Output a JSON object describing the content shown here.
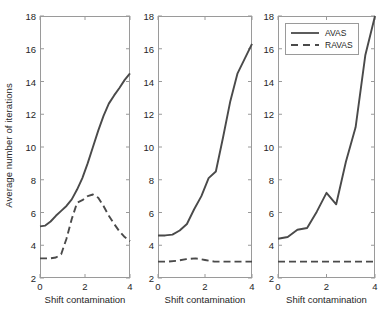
{
  "chart_data": {
    "type": "line",
    "title": "",
    "xlabel": "Shift contamination",
    "ylabel": "Average number of iterations",
    "xlim": [
      0,
      4
    ],
    "ylim": [
      2,
      18
    ],
    "xticks": [
      0,
      2,
      4
    ],
    "yticks": [
      2,
      4,
      6,
      8,
      10,
      12,
      14,
      16,
      18
    ],
    "xtick_labels": [
      "0",
      "2",
      "4"
    ],
    "ytick_labels": [
      "2",
      "4",
      "6",
      "8",
      "10",
      "12",
      "14",
      "16",
      "18"
    ],
    "grid": false,
    "legend_position": "top-left of third panel",
    "legend_entries": [
      "AVAS",
      "RAVAS"
    ],
    "line_color": "#4a4a4a",
    "panels": [
      {
        "name": "panel-1",
        "xlabel": "Shift contamination",
        "series": [
          {
            "name": "AVAS",
            "style": "solid",
            "x": [
              0,
              0.25,
              0.5,
              0.75,
              1,
              1.25,
              1.5,
              1.75,
              2,
              2.25,
              2.5,
              2.75,
              3,
              3.25,
              3.5,
              3.75,
              4
            ],
            "values": [
              5.15,
              5.2,
              5.45,
              5.8,
              6.1,
              6.4,
              6.8,
              7.4,
              8.1,
              9.0,
              10.0,
              11.0,
              11.9,
              12.65,
              13.15,
              13.6,
              14.1,
              14.5
            ]
          },
          {
            "name": "RAVAS",
            "style": "dashed",
            "x": [
              0,
              0.25,
              0.5,
              0.75,
              1,
              1.25,
              1.5,
              1.75,
              2,
              2.25,
              2.5,
              2.75,
              3,
              3.25,
              3.5,
              3.75,
              4
            ],
            "values": [
              3.2,
              3.2,
              3.2,
              3.25,
              3.45,
              4.4,
              5.6,
              6.6,
              6.75,
              7.0,
              7.1,
              6.9,
              6.4,
              5.8,
              5.3,
              4.85,
              4.5,
              4.25
            ]
          }
        ]
      },
      {
        "name": "panel-2",
        "xlabel": "Shift contamination",
        "series": [
          {
            "name": "AVAS",
            "style": "solid",
            "x": [
              0,
              0.25,
              0.5,
              0.75,
              1,
              1.5,
              2,
              2.5,
              3,
              3.5,
              4
            ],
            "values": [
              4.6,
              4.6,
              4.65,
              4.9,
              5.3,
              6.2,
              7.0,
              8.1,
              8.5,
              10.6,
              12.8,
              14.5,
              15.4,
              16.3
            ]
          },
          {
            "name": "RAVAS",
            "style": "dashed",
            "x": [
              0,
              0.25,
              0.5,
              0.75,
              1,
              1.5,
              2,
              2.5,
              3,
              3.5,
              4
            ],
            "values": [
              3.0,
              3.0,
              3.05,
              3.15,
              3.2,
              3.1,
              3.0,
              3.0,
              3.0,
              3.0,
              3.0
            ]
          }
        ]
      },
      {
        "name": "panel-3",
        "xlabel": "Shift contamination",
        "series": [
          {
            "name": "AVAS",
            "style": "solid",
            "x": [
              0,
              0.5,
              1,
              1.5,
              2,
              2.5,
              3,
              3.5,
              4
            ],
            "values": [
              4.4,
              4.5,
              4.95,
              5.05,
              6.05,
              7.2,
              6.5,
              9.1,
              11.2,
              15.6,
              18.0
            ]
          },
          {
            "name": "RAVAS",
            "style": "dashed",
            "x": [
              0,
              0.5,
              1,
              1.5,
              2,
              2.5,
              3,
              3.5,
              4
            ],
            "values": [
              3.0,
              3.0,
              3.0,
              3.0,
              3.0,
              3.0,
              3.0,
              3.0,
              3.0
            ]
          }
        ]
      }
    ]
  },
  "axis": {
    "ylabel": "Average number of iterations",
    "xlabel": "Shift contamination",
    "ytick_labels": [
      "2",
      "4",
      "6",
      "8",
      "10",
      "12",
      "14",
      "16",
      "18"
    ],
    "xtick_labels": [
      "0",
      "2",
      "4"
    ]
  },
  "legend": {
    "avas_label": "AVAS",
    "ravas_label": "RAVAS"
  }
}
